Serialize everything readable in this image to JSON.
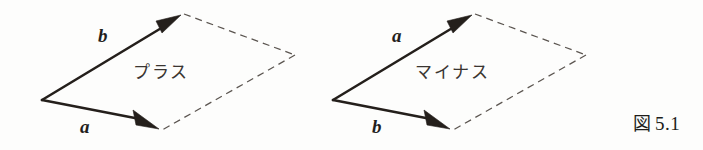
{
  "figure": {
    "caption_label": "図",
    "caption_number": "5.1",
    "background_color": "#fdfdfc",
    "ink_color": "#241f1b",
    "dashed_color": "#5b5550"
  },
  "diagrams": [
    {
      "id": "plus",
      "inner_label": "プラス",
      "upper_vector_label": "b",
      "lower_vector_label": "a",
      "origin": {
        "x": 42,
        "y": 100
      },
      "upper_tip": {
        "x": 180,
        "y": 17
      },
      "lower_tip": {
        "x": 157,
        "y": 128
      },
      "far_vertex": {
        "x": 295,
        "y": 55
      }
    },
    {
      "id": "minus",
      "inner_label": "マイナス",
      "upper_vector_label": "a",
      "lower_vector_label": "b",
      "origin": {
        "x": 333,
        "y": 100
      },
      "upper_tip": {
        "x": 471,
        "y": 17
      },
      "lower_tip": {
        "x": 448,
        "y": 128
      },
      "far_vertex": {
        "x": 586,
        "y": 55
      }
    }
  ]
}
